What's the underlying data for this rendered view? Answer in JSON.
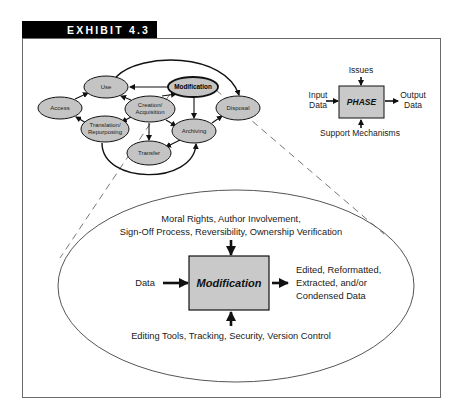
{
  "header": {
    "title": "EXHIBIT 4.3"
  },
  "colors": {
    "header_bg": "#000000",
    "node_fill": "#c4c4c4",
    "box_fill": "#c9c9c9",
    "stroke": "#111111",
    "frame": "#6a6a6a",
    "dashed": "#777777"
  },
  "lifecycle": {
    "nodes": [
      {
        "id": "use",
        "label": "Use"
      },
      {
        "id": "access",
        "label": "Access"
      },
      {
        "id": "translation",
        "label_line1": "Translation/",
        "label_line2": "Repurposing"
      },
      {
        "id": "creation",
        "label_line1": "Creation/",
        "label_line2": "Acquisition"
      },
      {
        "id": "modification",
        "label": "Modification",
        "highlighted": true
      },
      {
        "id": "archiving",
        "label": "Archiving"
      },
      {
        "id": "transfer",
        "label": "Transfer"
      },
      {
        "id": "disposal",
        "label": "Disposal"
      }
    ]
  },
  "legend": {
    "top": "Issues",
    "left_line1": "Input",
    "left_line2": "Data",
    "box": "PHASE",
    "right_line1": "Output",
    "right_line2": "Data",
    "bottom": "Support Mechanisms"
  },
  "detail": {
    "issues_line1": "Moral Rights, Author Involvement,",
    "issues_line2": "Sign-Off Process, Reversibility, Ownership Verification",
    "input": "Data",
    "box": "Modification",
    "output_line1": "Edited, Reformatted,",
    "output_line2": "Extracted, and/or",
    "output_line3": "Condensed Data",
    "support": "Editing Tools, Tracking, Security, Version Control"
  }
}
